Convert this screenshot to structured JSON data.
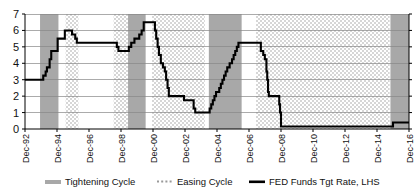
{
  "chart_data": {
    "type": "line",
    "title": "",
    "subtitle": "",
    "xlabel": "",
    "ylabel": "",
    "xlim": [
      "Dec-92",
      "Dec-16"
    ],
    "ylim": [
      0,
      7
    ],
    "ytick_labels": [
      "0",
      "1",
      "2",
      "3",
      "4",
      "5",
      "6",
      "7"
    ],
    "ytick_values": [
      0,
      1,
      2,
      3,
      4,
      5,
      6,
      7
    ],
    "xtick_labels": [
      "Dec-92",
      "Dec-94",
      "Dec-96",
      "Dec-98",
      "Dec-00",
      "Dec-02",
      "Dec-04",
      "Dec-06",
      "Dec-08",
      "Dec-10",
      "Dec-12",
      "Dec-14",
      "Dec-16"
    ],
    "xtick_values": [
      1992.96,
      1994.96,
      1996.96,
      1998.96,
      2000.96,
      2002.96,
      2004.96,
      2006.96,
      2008.96,
      2010.96,
      2012.96,
      2014.96,
      2016.96
    ],
    "grid": "horizontal",
    "legend_position": "bottom",
    "series": [
      {
        "name": "FED Funds Tgt Rate, LHS",
        "color": "#000000",
        "style": "step",
        "x": [
          1992.96,
          1993.9,
          1994.1,
          1994.25,
          1994.33,
          1994.5,
          1994.6,
          1994.8,
          1995.0,
          1995.1,
          1995.45,
          1995.55,
          1995.9,
          1996.0,
          1996.1,
          1996.2,
          1998.55,
          1998.7,
          1998.8,
          1998.95,
          1999.45,
          1999.6,
          1999.8,
          1999.95,
          2000.1,
          2000.25,
          2000.38,
          2000.9,
          2001.0,
          2001.08,
          2001.16,
          2001.25,
          2001.33,
          2001.45,
          2001.58,
          2001.7,
          2001.78,
          2001.87,
          2001.95,
          2002.9,
          2003.0,
          2003.5,
          2003.6,
          2004.0,
          2004.45,
          2004.5,
          2004.6,
          2004.7,
          2004.8,
          2004.9,
          2005.0,
          2005.1,
          2005.2,
          2005.3,
          2005.4,
          2005.5,
          2005.6,
          2005.75,
          2005.9,
          2006.0,
          2006.1,
          2006.2,
          2006.3,
          2006.45,
          2006.5,
          2007.6,
          2007.7,
          2007.85,
          2007.95,
          2008.05,
          2008.1,
          2008.15,
          2008.2,
          2008.3,
          2008.85,
          2008.9,
          2008.96,
          2015.85,
          2015.96,
          2016.96
        ],
        "y": [
          3.0,
          3.0,
          3.25,
          3.5,
          3.75,
          4.25,
          4.75,
          4.75,
          5.5,
          5.5,
          6.0,
          6.0,
          5.75,
          5.75,
          5.5,
          5.25,
          5.25,
          5.0,
          4.75,
          4.75,
          5.0,
          5.25,
          5.5,
          5.5,
          5.75,
          6.0,
          6.5,
          6.5,
          6.5,
          6.0,
          5.5,
          5.0,
          4.5,
          4.0,
          3.75,
          3.5,
          3.0,
          2.5,
          2.0,
          1.75,
          1.75,
          1.25,
          1.0,
          1.0,
          1.0,
          1.25,
          1.5,
          1.75,
          2.0,
          2.25,
          2.25,
          2.5,
          2.75,
          3.0,
          3.25,
          3.5,
          3.75,
          4.0,
          4.25,
          4.5,
          4.75,
          5.0,
          5.25,
          5.25,
          5.25,
          5.25,
          4.75,
          4.5,
          4.25,
          3.5,
          3.0,
          2.25,
          2.0,
          2.0,
          1.5,
          1.0,
          0.15,
          0.15,
          0.4,
          0.4
        ]
      }
    ],
    "shaded_bands": [
      {
        "label": "Tightening Cycle",
        "type": "tightening",
        "start": 1993.9,
        "end": 1995.05
      },
      {
        "label": "Easing Cycle",
        "type": "easing",
        "start": 1995.5,
        "end": 1996.3
      },
      {
        "label": "Easing Cycle",
        "type": "easing",
        "start": 1998.5,
        "end": 1999.4
      },
      {
        "label": "Tightening Cycle",
        "type": "tightening",
        "start": 1999.4,
        "end": 2000.5
      },
      {
        "label": "Easing Cycle",
        "type": "easing",
        "start": 2000.9,
        "end": 2004.2
      },
      {
        "label": "Tightening Cycle",
        "type": "tightening",
        "start": 2004.45,
        "end": 2006.5
      },
      {
        "label": "Easing Cycle",
        "type": "easing",
        "start": 2007.4,
        "end": 2015.75
      },
      {
        "label": "Tightening Cycle",
        "type": "tightening",
        "start": 2015.8,
        "end": 2016.96
      }
    ],
    "colors": {
      "tightening": "#a8a8a8",
      "easing_base": "#ffffff",
      "easing_dots": "#9a9a9a",
      "line": "#000000",
      "grid": "#888888",
      "axis": "#000000",
      "background": "#ffffff"
    }
  },
  "legend": {
    "items": [
      {
        "label": "Tightening Cycle",
        "swatch": "tightening-swatch"
      },
      {
        "label": "Easing Cycle",
        "swatch": "easing-swatch"
      },
      {
        "label": "FED Funds Tgt Rate, LHS",
        "swatch": "line-swatch"
      }
    ]
  }
}
